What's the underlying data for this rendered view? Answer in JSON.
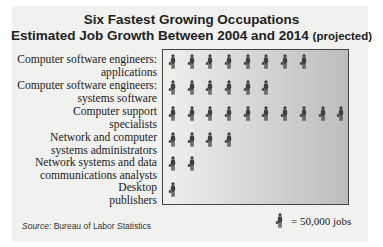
{
  "title_line1": "Six Fastest Growing Occupations",
  "title_line2": "Estimated Job Growth Between 2004 and 2014",
  "title_line2_suffix": "(projected)",
  "source_label": "Source:",
  "source_text": "Bureau of Labor Statistics",
  "legend": {
    "text": "= 50,000 jobs",
    "icon": "person-with-briefcase-icon"
  },
  "rows": [
    {
      "line1": "Computer software engineers:",
      "line2": "applications",
      "icons": 8
    },
    {
      "line1": "Computer software engineers:",
      "line2": "systems software",
      "icons": 6
    },
    {
      "line1": "Computer support",
      "line2": "specialists",
      "icons": 10
    },
    {
      "line1": "Network and computer",
      "line2": "systems administrators",
      "icons": 4
    },
    {
      "line1": "Network systems and data",
      "line2": "communications analysts",
      "icons": 2
    },
    {
      "line1": "Desktop",
      "line2": "publishers",
      "icons": 0.5
    }
  ],
  "chart_data": {
    "type": "bar",
    "subtype": "pictograph",
    "categories": [
      "Computer software engineers: applications",
      "Computer software engineers: systems software",
      "Computer support specialists",
      "Network and computer systems administrators",
      "Network systems and data communications analysts",
      "Desktop publishers"
    ],
    "icon_counts": [
      8,
      6,
      10,
      4,
      2,
      0.5
    ],
    "values": [
      400000,
      300000,
      500000,
      200000,
      100000,
      25000
    ],
    "unit": "jobs",
    "icon_value": 50000,
    "legend": "icon = 50,000 jobs",
    "source": "Bureau of Labor Statistics",
    "orientation": "horizontal",
    "grid": false
  }
}
